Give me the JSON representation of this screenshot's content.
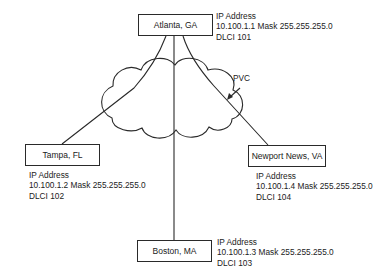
{
  "diagram": {
    "type": "frame-relay-network",
    "cloud_label": "PVC",
    "nodes": [
      {
        "id": "atlanta",
        "label": "Atlanta, GA",
        "info_title": "IP Address",
        "ip_line": "10.100.1.1 Mask 255.255.255.0",
        "dlci": "DLCI 101"
      },
      {
        "id": "tampa",
        "label": "Tampa, FL",
        "info_title": "IP Address",
        "ip_line": "10.100.1.2 Mask 255.255.255.0",
        "dlci": "DLCI 102"
      },
      {
        "id": "newport",
        "label": "Newport News, VA",
        "info_title": "IP Address",
        "ip_line": "10.100.1.4 Mask 255.255.255.0",
        "dlci": "DLCI 104"
      },
      {
        "id": "boston",
        "label": "Boston, MA",
        "info_title": "IP Address",
        "ip_line": "10.100.1.3 Mask 255.255.255.0",
        "dlci": "DLCI 103"
      }
    ],
    "edges": [
      {
        "from": "Atlanta, GA",
        "to": "Tampa, FL"
      },
      {
        "from": "Atlanta, GA",
        "to": "Boston, MA"
      },
      {
        "from": "Atlanta, GA",
        "to": "Newport News, VA"
      }
    ],
    "colors": {
      "line": "#2a2a2a",
      "background": "#ffffff",
      "text": "#222222"
    }
  }
}
